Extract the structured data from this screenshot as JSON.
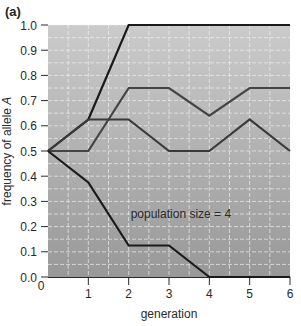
{
  "panel_label": "(a)",
  "chart_data": {
    "type": "line",
    "title": "",
    "xlabel": "generation",
    "ylabel": "frequency of allele A",
    "ylabel_parts": {
      "prefix": "frequency of allele ",
      "italic": "A"
    },
    "x": [
      0,
      1,
      2,
      3,
      4,
      5,
      6
    ],
    "xlim": [
      0,
      6
    ],
    "ylim": [
      0.0,
      1.0
    ],
    "x_ticks": [
      "0",
      "1",
      "2",
      "3",
      "4",
      "5",
      "6"
    ],
    "y_ticks": [
      "0.0",
      "0.1",
      "0.2",
      "0.3",
      "0.4",
      "0.5",
      "0.6",
      "0.7",
      "0.8",
      "0.9",
      "1.0"
    ],
    "grid": true,
    "legend": null,
    "annotation": {
      "text": "population size = 4",
      "x": 2.05,
      "y": 0.25
    },
    "series": [
      {
        "name": "population 1",
        "color": "#1a1a1a",
        "values": [
          0.5,
          0.625,
          1.0,
          1.0,
          1.0,
          1.0,
          1.0
        ]
      },
      {
        "name": "population 2",
        "color": "#444444",
        "values": [
          0.5,
          0.5,
          0.75,
          0.75,
          0.64,
          0.75,
          0.75
        ]
      },
      {
        "name": "population 3",
        "color": "#3a3a3a",
        "values": [
          0.5,
          0.625,
          0.625,
          0.5,
          0.5,
          0.625,
          0.5
        ]
      },
      {
        "name": "population 4",
        "color": "#1a1a1a",
        "values": [
          0.5,
          0.375,
          0.125,
          0.125,
          0.0,
          0.0,
          0.0
        ]
      }
    ],
    "style": {
      "plot_bg_top": "#cbcbcb",
      "plot_bg_bottom": "#989898",
      "grid_color": "#f2f2f2",
      "axis_color": "#2a2a2a"
    }
  }
}
